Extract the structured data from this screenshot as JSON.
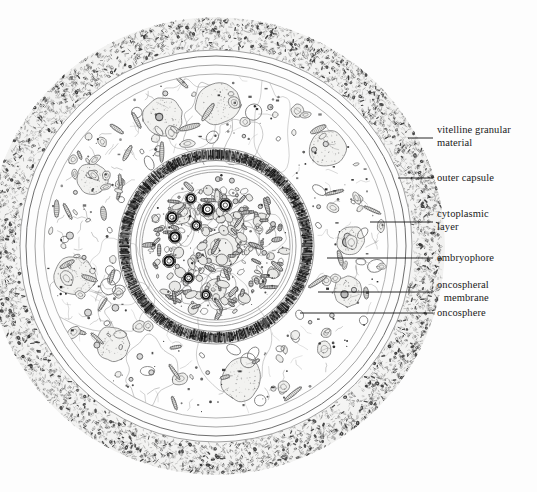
{
  "figure": {
    "kind": "scientific-illustration",
    "background_color": "#fdfdfd",
    "ink_color": "#3a3a3a",
    "dark_ink_color": "#1a1a1a",
    "fill_tint": "#f0f0ee"
  },
  "labels": [
    {
      "id": "vitelline-granular-material",
      "text": "vitelline granular\nmaterial",
      "text_x": 437,
      "text_y": 124,
      "align": "left",
      "leader": {
        "x1": 408,
        "y1": 138,
        "x2": 433,
        "y2": 138
      }
    },
    {
      "id": "outer-capsule",
      "text": "outer capsule",
      "text_x": 437,
      "text_y": 172,
      "align": "left",
      "leader": {
        "x1": 398,
        "y1": 178,
        "x2": 433,
        "y2": 178
      }
    },
    {
      "id": "cytoplasmic-layer",
      "text": "cytoplasmic\nlayer",
      "text_x": 437,
      "text_y": 208,
      "align": "left",
      "leader": {
        "x1": 370,
        "y1": 222,
        "x2": 433,
        "y2": 222
      }
    },
    {
      "id": "embryophore",
      "text": "embryophore",
      "text_x": 437,
      "text_y": 252,
      "align": "left",
      "leader": {
        "x1": 327,
        "y1": 258,
        "x2": 433,
        "y2": 258
      }
    },
    {
      "id": "oncospheral-membrane",
      "text": "oncospheral\nmembrane",
      "text_x": 437,
      "text_y": 279,
      "align": "left",
      "leader": {
        "x1": 318,
        "y1": 292,
        "x2": 433,
        "y2": 292
      }
    },
    {
      "id": "oncosphere",
      "text": "oncosphere",
      "text_x": 437,
      "text_y": 307,
      "align": "left",
      "leader": {
        "x1": 300,
        "y1": 313,
        "x2": 433,
        "y2": 313
      }
    }
  ],
  "geometry": {
    "center_x": 216,
    "center_y": 246,
    "vitelline_outer_r": 229,
    "vitelline_inner_r": 196,
    "outer_capsule_r": 190,
    "capsule_inner_r": 181,
    "cytoplasm_outer_r": 172,
    "embryophore_outer_r": 97,
    "embryophore_inner_r": 86,
    "oncospheral_membrane_r": 80,
    "oncosphere_r": 74
  }
}
